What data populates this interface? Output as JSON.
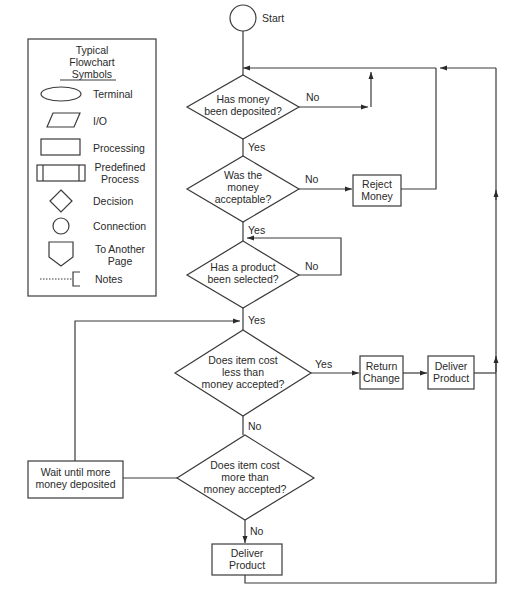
{
  "legend": {
    "title_lines": [
      "Typical",
      "Flowchart",
      "Symbols"
    ],
    "items": [
      {
        "symbol": "terminal-ellipse",
        "label": [
          "Terminal"
        ]
      },
      {
        "symbol": "io-parallelogram",
        "label": [
          "I/O"
        ]
      },
      {
        "symbol": "processing-rectangle",
        "label": [
          "Processing"
        ]
      },
      {
        "symbol": "predefined-process",
        "label": [
          "Predefined",
          "Process"
        ]
      },
      {
        "symbol": "decision-diamond",
        "label": [
          "Decision"
        ]
      },
      {
        "symbol": "connection-circle",
        "label": [
          "Connection"
        ]
      },
      {
        "symbol": "off-page-pentagon",
        "label": [
          "To Another",
          "Page"
        ]
      },
      {
        "symbol": "notes-bracket",
        "label": [
          "Notes"
        ]
      }
    ]
  },
  "flowchart": {
    "start": {
      "label": "Start"
    },
    "nodes": [
      {
        "id": "d1",
        "type": "decision",
        "lines": [
          "Has money",
          "been deposited?"
        ]
      },
      {
        "id": "d2",
        "type": "decision",
        "lines": [
          "Was the",
          "money",
          "acceptable?"
        ]
      },
      {
        "id": "p_reject",
        "type": "process",
        "lines": [
          "Reject",
          "Money"
        ]
      },
      {
        "id": "d3",
        "type": "decision",
        "lines": [
          "Has a product",
          "been selected?"
        ]
      },
      {
        "id": "d4",
        "type": "decision",
        "lines": [
          "Does item cost",
          "less than",
          "money accepted?"
        ]
      },
      {
        "id": "p_change",
        "type": "process",
        "lines": [
          "Return",
          "Change"
        ]
      },
      {
        "id": "p_deliver1",
        "type": "process",
        "lines": [
          "Deliver",
          "Product"
        ]
      },
      {
        "id": "d5",
        "type": "decision",
        "lines": [
          "Does item cost",
          "more than",
          "money accepted?"
        ]
      },
      {
        "id": "p_wait",
        "type": "process",
        "lines": [
          "Wait until more",
          "money deposited"
        ]
      },
      {
        "id": "p_deliver2",
        "type": "process",
        "lines": [
          "Deliver",
          "Product"
        ]
      }
    ],
    "edge_labels": {
      "d1_no": "No",
      "d1_yes": "Yes",
      "d2_no": "No",
      "d2_yes": "Yes",
      "d3_no": "No",
      "d3_yes": "Yes",
      "d4_yes": "Yes",
      "d4_no": "No",
      "d5_no": "No"
    }
  }
}
